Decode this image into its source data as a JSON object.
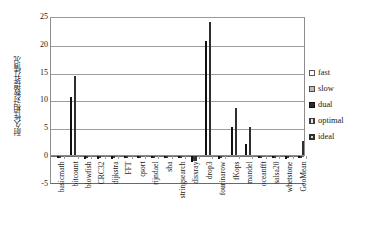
{
  "chart_data": {
    "type": "bar",
    "title": "",
    "xlabel": "",
    "ylabel": "耐久性相对数提升情况",
    "ylim": [
      -5,
      25
    ],
    "yticks": [
      25,
      20,
      15,
      10,
      5,
      0,
      -5
    ],
    "ytick_labels": [
      "25",
      "20",
      "15",
      "10",
      "5",
      "0",
      "-5"
    ],
    "grid": true,
    "legend_position": "right",
    "categories": [
      "basicmath",
      "bitcount",
      "blowfish",
      "CRC32",
      "dijkstra",
      "FFT",
      "qsort",
      "rijndael",
      "sha",
      "stringsearch",
      "disxray",
      "drop3",
      "fourinarow",
      "fKops",
      "mandel",
      "oceanfft",
      "salsa20",
      "whetstone",
      "GeoMean"
    ],
    "series": [
      {
        "name": "fast",
        "values": [
          0,
          0,
          0,
          0,
          0,
          0,
          0,
          0,
          0,
          0,
          0,
          0,
          0,
          0,
          0,
          0,
          0,
          0,
          0
        ]
      },
      {
        "name": "slow",
        "values": [
          0,
          0,
          0,
          0,
          0,
          0,
          0,
          0,
          0,
          0,
          0,
          0,
          0,
          0,
          0,
          0,
          0,
          0,
          0
        ]
      },
      {
        "name": "dual",
        "values": [
          -0.4,
          10.5,
          -0.5,
          -0.5,
          -0.5,
          -0.4,
          -0.4,
          -0.4,
          -0.4,
          -0.4,
          -1.1,
          20.5,
          -0.5,
          5.1,
          2.0,
          -0.4,
          -0.2,
          -0.6,
          -0.3
        ]
      },
      {
        "name": "optimal",
        "values": [
          -0.3,
          0,
          -0.3,
          -0.3,
          -0.3,
          -0.3,
          -0.3,
          -0.3,
          -0.3,
          -0.3,
          -0.9,
          0,
          -0.3,
          0,
          0,
          -0.3,
          -0.2,
          -0.3,
          -0.2
        ]
      },
      {
        "name": "ideal",
        "values": [
          0,
          14.3,
          0,
          0,
          0,
          0,
          0,
          0,
          0,
          0,
          -0.9,
          24.0,
          0,
          8.5,
          5.1,
          0,
          0,
          0,
          2.5
        ]
      }
    ]
  },
  "legend": {
    "items": [
      {
        "label": "fast",
        "swatch": "swatch-hollow-icon"
      },
      {
        "label": "slow",
        "swatch": "swatch-gray-icon"
      },
      {
        "label": "dual",
        "swatch": "swatch-black-icon"
      },
      {
        "label": "optimal",
        "swatch": "swatch-vertical-hatch-icon"
      },
      {
        "label": "ideal",
        "swatch": "swatch-crosshatch-icon"
      }
    ]
  }
}
